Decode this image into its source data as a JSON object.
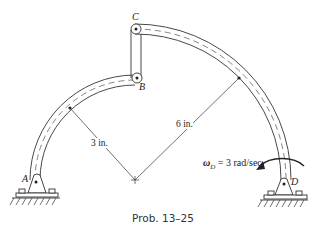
{
  "figure": {
    "title": "Prob. 13–25",
    "points": {
      "A": "A",
      "B": "B",
      "C": "C",
      "D": "D"
    },
    "dimensions": {
      "small_radius": "3 in.",
      "large_radius": "6 in."
    },
    "angular_velocity": {
      "symbol": "ω",
      "subscript": "D",
      "value_text": " = 3 rad/sec"
    },
    "colors": {
      "line": "#333333",
      "background": "#ffffff"
    }
  }
}
